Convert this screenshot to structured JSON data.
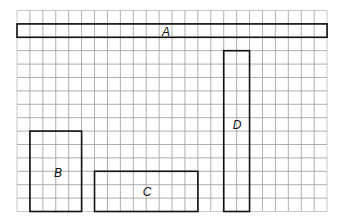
{
  "grid": {
    "origin_x": 17,
    "origin_y": 10.5,
    "cell_w": 12.92,
    "cell_h": 13.4,
    "cols": 24,
    "rows": 15,
    "line_color": "#9a9a9a",
    "border_color": "#bdbdbd"
  },
  "shape_style": {
    "stroke": "#111111",
    "stroke_width": 1.6
  },
  "shapes": [
    {
      "id": "A",
      "label": "A",
      "col": 0,
      "row": 1,
      "w": 24,
      "h": 1
    },
    {
      "id": "B",
      "label": "B",
      "col": 1,
      "row": 9,
      "w": 4,
      "h": 6
    },
    {
      "id": "C",
      "label": "C",
      "col": 6,
      "row": 12,
      "w": 8,
      "h": 3
    },
    {
      "id": "D",
      "label": "D",
      "col": 16,
      "row": 3,
      "w": 2,
      "h": 12
    }
  ],
  "label_positions": {
    "A": {
      "x": 166,
      "y": 36
    },
    "B": {
      "x": 58,
      "y": 177
    },
    "C": {
      "x": 147,
      "y": 196
    },
    "D": {
      "x": 237,
      "y": 129
    }
  }
}
